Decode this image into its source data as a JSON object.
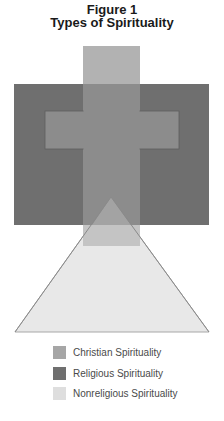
{
  "figure": {
    "number_label": "Figure 1",
    "title": "Types of Spirituality"
  },
  "colors": {
    "christian": "#b2b2b2",
    "christian_overlap": "#8c8c8c",
    "religious": "#6f6f6f",
    "nonreligious": "#e8e8e8",
    "nonreligious_edge": "#a8a8a8"
  },
  "legend": [
    {
      "label": "Christian Spirituality",
      "color": "#a6a6a6"
    },
    {
      "label": "Religious Spirituality",
      "color": "#6f6f6f"
    },
    {
      "label": "Nonreligious Spirituality",
      "color": "#dedede"
    }
  ]
}
